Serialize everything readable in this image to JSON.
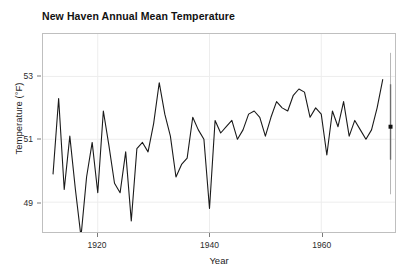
{
  "chart_data": {
    "type": "line",
    "title": "New Haven Annual Mean Temperature",
    "xlabel": "Year",
    "ylabel": "Temperature (°F)",
    "xlim": [
      1910.2,
      1973.2
    ],
    "ylim": [
      48.05,
      54.35
    ],
    "grid": true,
    "legend": "none",
    "x_ticks": [
      1920,
      1940,
      1960
    ],
    "y_ticks": [
      49,
      51,
      53
    ],
    "x_tick_labels": [
      "1920",
      "1940",
      "1960"
    ],
    "y_tick_labels": [
      "49",
      "51",
      "53"
    ],
    "series": [
      {
        "name": "Annual mean temperature",
        "color": "#1a1a1a",
        "line_width": 1.1,
        "x": [
          1912,
          1913,
          1914,
          1915,
          1916,
          1917,
          1918,
          1919,
          1920,
          1921,
          1922,
          1923,
          1924,
          1925,
          1926,
          1927,
          1928,
          1929,
          1930,
          1931,
          1932,
          1933,
          1934,
          1935,
          1936,
          1937,
          1938,
          1939,
          1940,
          1941,
          1942,
          1943,
          1944,
          1945,
          1946,
          1947,
          1948,
          1949,
          1950,
          1951,
          1952,
          1953,
          1954,
          1955,
          1956,
          1957,
          1958,
          1959,
          1960,
          1961,
          1962,
          1963,
          1964,
          1965,
          1966,
          1967,
          1968,
          1969,
          1970,
          1971
        ],
        "y": [
          49.9,
          52.3,
          49.4,
          51.1,
          49.4,
          47.9,
          49.8,
          50.9,
          49.3,
          51.9,
          50.8,
          49.6,
          49.3,
          50.6,
          48.4,
          50.7,
          50.9,
          50.6,
          51.5,
          52.8,
          51.8,
          51.1,
          49.8,
          50.2,
          50.4,
          51.7,
          51.3,
          51.0,
          48.8,
          51.6,
          51.2,
          51.4,
          51.6,
          51.0,
          51.3,
          51.8,
          51.9,
          51.7,
          51.1,
          51.7,
          52.2,
          52.0,
          51.9,
          52.4,
          52.6,
          52.5,
          51.7,
          52.0,
          51.8,
          50.5,
          51.9,
          51.4,
          52.2,
          51.1,
          51.6,
          51.3,
          51.0,
          51.3,
          52.0,
          52.9
        ],
        "estimated": true,
        "note": "values read from plotted line; digits at 0.1 °F precision"
      }
    ],
    "annotations": [
      {
        "type": "pointrange",
        "name": "summary-pointrange",
        "x": 1972.4,
        "y": 51.4,
        "ymin_outer": 49.25,
        "ymax_outer": 53.75,
        "ymin_inner": 50.35,
        "ymax_inner": 52.75,
        "outer_color": "#b5b5b5",
        "inner_color": "#6e6e6e",
        "point_color": "#111111",
        "point_size": 4
      }
    ]
  },
  "panel": {
    "background": "#ffffff",
    "border_color": "#bfbfbf",
    "grid_color": "#ededed"
  },
  "page": {
    "background": "#ffffff"
  }
}
